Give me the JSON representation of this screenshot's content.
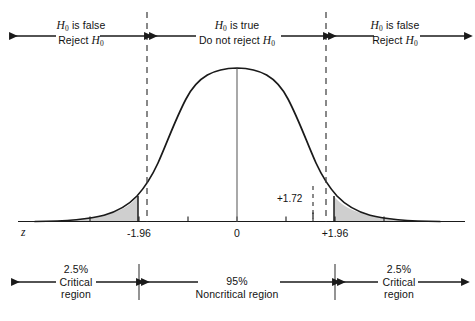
{
  "chart_data": {
    "type": "area",
    "xlabel": "z",
    "ylabel": "",
    "xlim": [
      -3.6,
      3.6
    ],
    "ylim": [
      0,
      1.08
    ],
    "grid": false,
    "legend_position": "none",
    "distribution": "standard normal (z)",
    "x_tick_labels": [
      "-1.96",
      "0",
      "+1.96"
    ],
    "x_tick_values": [
      -1.96,
      0,
      1.96
    ],
    "unlabeled_tick_values": [
      -3,
      -2,
      -1,
      1,
      2,
      3
    ],
    "critical_values": [
      -1.96,
      1.96
    ],
    "shaded_tails": [
      {
        "side": "left",
        "from": -3.6,
        "to": -1.96,
        "area_percent": 2.5,
        "fill": "#cfcfcf"
      },
      {
        "side": "right",
        "from": 1.96,
        "to": 3.6,
        "area_percent": 2.5,
        "fill": "#cfcfcf"
      }
    ],
    "center_area_percent": 95,
    "test_statistic": {
      "label": "+1.72",
      "value": 1.72
    },
    "curve_color": "#1a1a1a",
    "fill_color": "#cfcfcf"
  },
  "top_band": {
    "segments": [
      {
        "name": "left-reject",
        "line1_html": "<span class='it'>H</span><sub>0</sub> is false",
        "line2_html": "Reject <span class='it'>H</span><sub>0</sub>"
      },
      {
        "name": "center-accept",
        "line1_html": "<span class='it'>H</span><sub>0</sub> is true",
        "line2_html": "Do not reject <span class='it'>H</span><sub>0</sub>"
      },
      {
        "name": "right-reject",
        "line1_html": "<span class='it'>H</span><sub>0</sub> is false",
        "line2_html": "Reject <span class='it'>H</span><sub>0</sub>"
      }
    ]
  },
  "bottom_band": {
    "segments": [
      {
        "name": "left-critical",
        "percent": "2.5%",
        "line2": "Critical",
        "line3": "region"
      },
      {
        "name": "noncritical",
        "percent": "95%",
        "line2": "Noncritical region",
        "line3": ""
      },
      {
        "name": "right-critical",
        "percent": "2.5%",
        "line2": "Critical",
        "line3": "region"
      }
    ]
  },
  "axis": {
    "name": "z",
    "tick_left": "-1.96",
    "tick_center": "0",
    "tick_right": "+1.96"
  },
  "annotation": {
    "test_statistic_label": "+1.72"
  },
  "colors": {
    "ink": "#1a1a1a",
    "tail_fill": "#cfcfcf",
    "background": "#ffffff"
  }
}
